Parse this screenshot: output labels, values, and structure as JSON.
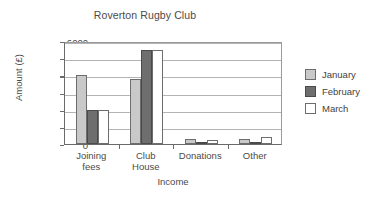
{
  "chart_data": {
    "type": "bar",
    "title": "Roverton Rugby Club",
    "xlabel": "Income",
    "ylabel": "Amount (£)",
    "categories": [
      "Joining fees",
      "Club House",
      "Donations",
      "Other"
    ],
    "category_lines": [
      [
        "Joining",
        "fees"
      ],
      [
        "Club",
        "House"
      ],
      [
        "Donations",
        ""
      ],
      [
        "Other",
        ""
      ]
    ],
    "series": [
      {
        "name": "January",
        "color": "#c9c9c9",
        "values": [
          4000,
          3800,
          300,
          280
        ]
      },
      {
        "name": "February",
        "color": "#6e6e6e",
        "values": [
          2000,
          5500,
          30,
          120
        ]
      },
      {
        "name": "March",
        "color": "#ffffff",
        "values": [
          2000,
          5500,
          250,
          430
        ]
      }
    ],
    "ylim": [
      0,
      6000
    ],
    "yticks": [
      0,
      1000,
      2000,
      3000,
      4000,
      5000,
      6000
    ],
    "ytick_labels": [
      "0",
      "1000",
      "2000",
      "3000",
      "4000",
      "5000",
      "6000"
    ],
    "grid": true,
    "legend_position": "right"
  }
}
